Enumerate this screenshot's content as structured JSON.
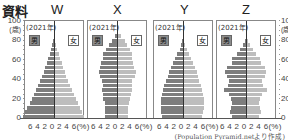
{
  "title": "資料",
  "source": "(Population Pyramid.netより作成)",
  "y_axis": {
    "unit": "(歳)",
    "ticks": [
      "100",
      "80",
      "60",
      "40",
      "20",
      "0"
    ]
  },
  "x_axis": {
    "tick_label": "6 4 2 0 2 4 6(%)"
  },
  "colors": {
    "male": "#7d7d7d",
    "female": "#bdbdbd",
    "frame": "#888888"
  },
  "chart_data": [
    {
      "type": "bar",
      "title": "W",
      "subtitle": "(2021年)",
      "legend": [
        "男",
        "女"
      ],
      "xlabel": "(%)",
      "ylabel": "(歳)",
      "xlim": [
        -6,
        6
      ],
      "ylim": [
        0,
        100
      ],
      "categories": [
        "0-4",
        "5-9",
        "10-14",
        "15-19",
        "20-24",
        "25-29",
        "30-34",
        "35-39",
        "40-44",
        "45-49",
        "50-54",
        "55-59",
        "60-64",
        "65-69",
        "70-74",
        "75-79",
        "80-84",
        "85-89",
        "90-94",
        "95-99",
        "100+"
      ],
      "series": [
        {
          "name": "男",
          "values": [
            6.4,
            6.0,
            5.5,
            5.0,
            4.6,
            4.1,
            3.7,
            3.3,
            2.9,
            2.5,
            2.1,
            1.8,
            1.5,
            1.2,
            0.9,
            0.6,
            0.4,
            0.2,
            0.1,
            0.0,
            0.0
          ]
        },
        {
          "name": "女",
          "values": [
            6.2,
            5.8,
            5.4,
            4.9,
            4.5,
            4.1,
            3.7,
            3.3,
            2.9,
            2.5,
            2.2,
            1.9,
            1.6,
            1.3,
            1.0,
            0.7,
            0.4,
            0.2,
            0.1,
            0.0,
            0.0
          ]
        }
      ]
    },
    {
      "type": "bar",
      "title": "X",
      "subtitle": "(2021年)",
      "legend": [
        "男",
        "女"
      ],
      "xlabel": "(%)",
      "ylabel": "(歳)",
      "xlim": [
        -6,
        6
      ],
      "ylim": [
        0,
        100
      ],
      "categories": [
        "0-4",
        "5-9",
        "10-14",
        "15-19",
        "20-24",
        "25-29",
        "30-34",
        "35-39",
        "40-44",
        "45-49",
        "50-54",
        "55-59",
        "60-64",
        "65-69",
        "70-74",
        "75-79",
        "80-84",
        "85-89",
        "90-94",
        "95-99",
        "100+"
      ],
      "series": [
        {
          "name": "男",
          "values": [
            2.4,
            2.4,
            2.4,
            2.5,
            2.8,
            3.0,
            3.2,
            3.0,
            3.2,
            3.6,
            3.8,
            3.5,
            3.3,
            3.0,
            2.8,
            2.2,
            1.6,
            1.0,
            0.4,
            0.1,
            0.0
          ]
        },
        {
          "name": "女",
          "values": [
            2.3,
            2.3,
            2.3,
            2.4,
            2.7,
            2.9,
            3.1,
            3.0,
            3.2,
            3.7,
            3.9,
            3.6,
            3.4,
            3.2,
            3.1,
            2.6,
            2.1,
            1.6,
            0.8,
            0.3,
            0.1
          ]
        }
      ]
    },
    {
      "type": "bar",
      "title": "Y",
      "subtitle": "(2021年)",
      "legend": [
        "男",
        "女"
      ],
      "xlabel": "(%)",
      "ylabel": "(歳)",
      "xlim": [
        -6,
        6
      ],
      "ylim": [
        0,
        100
      ],
      "categories": [
        "0-4",
        "5-9",
        "10-14",
        "15-19",
        "20-24",
        "25-29",
        "30-34",
        "35-39",
        "40-44",
        "45-49",
        "50-54",
        "55-59",
        "60-64",
        "65-69",
        "70-74",
        "75-79",
        "80-84",
        "85-89",
        "90-94",
        "95-99",
        "100+"
      ],
      "series": [
        {
          "name": "男",
          "values": [
            4.3,
            4.5,
            4.6,
            4.6,
            4.5,
            4.4,
            4.2,
            3.9,
            3.5,
            3.2,
            2.9,
            2.5,
            2.1,
            1.7,
            1.2,
            0.7,
            0.4,
            0.2,
            0.1,
            0.0,
            0.0
          ]
        },
        {
          "name": "女",
          "values": [
            4.0,
            4.2,
            4.3,
            4.3,
            4.3,
            4.2,
            4.0,
            3.8,
            3.4,
            3.1,
            2.8,
            2.5,
            2.1,
            1.7,
            1.3,
            0.8,
            0.5,
            0.2,
            0.1,
            0.0,
            0.0
          ]
        }
      ]
    },
    {
      "type": "bar",
      "title": "Z",
      "subtitle": "(2021年)",
      "legend": [
        "男",
        "女"
      ],
      "xlabel": "(%)",
      "ylabel": "(歳)",
      "xlim": [
        -6,
        6
      ],
      "ylim": [
        0,
        100
      ],
      "categories": [
        "0-4",
        "5-9",
        "10-14",
        "15-19",
        "20-24",
        "25-29",
        "30-34",
        "35-39",
        "40-44",
        "45-49",
        "50-54",
        "55-59",
        "60-64",
        "65-69",
        "70-74",
        "75-79",
        "80-84",
        "85-89",
        "90-94",
        "95-99",
        "100+"
      ],
      "series": [
        {
          "name": "男",
          "values": [
            3.0,
            3.4,
            3.2,
            3.0,
            3.1,
            3.6,
            4.6,
            3.7,
            3.5,
            4.0,
            4.3,
            4.0,
            3.0,
            2.8,
            1.9,
            1.2,
            0.7,
            0.3,
            0.1,
            0.0,
            0.0
          ]
        },
        {
          "name": "女",
          "values": [
            2.7,
            3.0,
            2.9,
            2.7,
            2.8,
            3.4,
            4.4,
            3.5,
            3.4,
            3.9,
            4.2,
            3.9,
            3.0,
            2.9,
            2.0,
            1.4,
            0.9,
            0.5,
            0.2,
            0.0,
            0.0
          ]
        }
      ]
    }
  ]
}
